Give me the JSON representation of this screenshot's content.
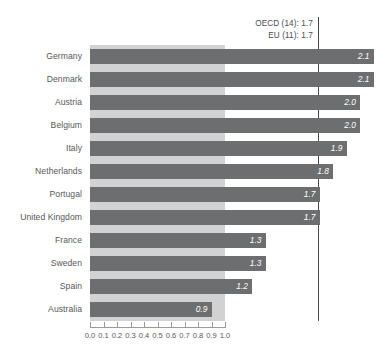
{
  "chart_data": {
    "type": "bar",
    "orientation": "horizontal",
    "title": "",
    "subtitle": "",
    "xlabel": "",
    "ylabel": "",
    "xlim": [
      0.0,
      1.0
    ],
    "axis_tick_labels": [
      "0.0",
      "0.1",
      "0.2",
      "0.3",
      "0.4",
      "0.5",
      "0.6",
      "0.7",
      "0.8",
      "0.9",
      "1.0"
    ],
    "axis_tick_values": [
      0.0,
      0.1,
      0.2,
      0.3,
      0.4,
      0.5,
      0.6,
      0.7,
      0.8,
      0.9,
      1.0
    ],
    "grid": false,
    "legend": "none",
    "categories": [
      "Germany",
      "Denmark",
      "Austria",
      "Belgium",
      "Italy",
      "Netherlands",
      "Portugal",
      "United Kingdom",
      "France",
      "Sweden",
      "Spain",
      "Australia"
    ],
    "values": [
      2.1,
      2.1,
      2.0,
      2.0,
      1.9,
      1.8,
      1.7,
      1.7,
      1.3,
      1.3,
      1.2,
      0.9
    ],
    "value_labels": [
      "2.1",
      "2.1",
      "2.0",
      "2.0",
      "1.9",
      "1.8",
      "1.7",
      "1.7",
      "1.3",
      "1.3",
      "1.2",
      "0.9"
    ],
    "annotations": [
      {
        "label": "OECD (14): 1.7",
        "value": 1.7
      },
      {
        "label": "EU (11): 1.7",
        "value": 1.7
      }
    ],
    "reference_line": {
      "value": 1.7
    },
    "colors": {
      "bar": "#6d6e70",
      "backdrop_band": "#d2d2d2",
      "reference_line": "#4a4a4c",
      "text": "#58585a",
      "value_label": "#ffffff",
      "background": "#ffffff"
    }
  },
  "bars": [
    {
      "label": "Germany",
      "value": 2.1,
      "value_label": "2.1"
    },
    {
      "label": "Denmark",
      "value": 2.1,
      "value_label": "2.1"
    },
    {
      "label": "Austria",
      "value": 2.0,
      "value_label": "2.0"
    },
    {
      "label": "Belgium",
      "value": 2.0,
      "value_label": "2.0"
    },
    {
      "label": "Italy",
      "value": 1.9,
      "value_label": "1.9"
    },
    {
      "label": "Netherlands",
      "value": 1.8,
      "value_label": "1.8"
    },
    {
      "label": "Portugal",
      "value": 1.7,
      "value_label": "1.7"
    },
    {
      "label": "United Kingdom",
      "value": 1.7,
      "value_label": "1.7"
    },
    {
      "label": "France",
      "value": 1.3,
      "value_label": "1.3"
    },
    {
      "label": "Sweden",
      "value": 1.3,
      "value_label": "1.3"
    },
    {
      "label": "Spain",
      "value": 1.2,
      "value_label": "1.2"
    },
    {
      "label": "Australia",
      "value": 0.9,
      "value_label": "0.9"
    }
  ],
  "annotations": [
    {
      "text": "OECD (14): 1.7"
    },
    {
      "text": "EU (11): 1.7"
    }
  ],
  "axis": {
    "ticks": [
      "0.0",
      "0.1",
      "0.2",
      "0.3",
      "0.4",
      "0.5",
      "0.6",
      "0.7",
      "0.8",
      "0.9",
      "1.0"
    ]
  }
}
